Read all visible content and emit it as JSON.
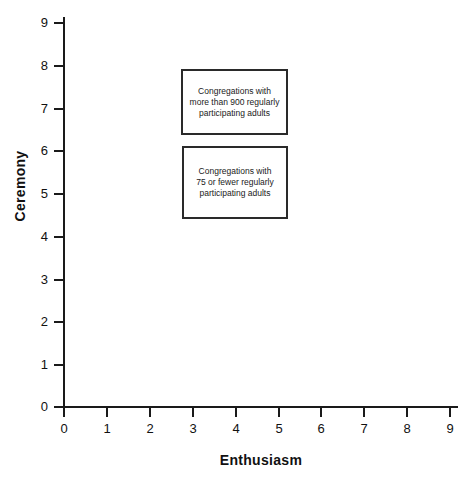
{
  "chart_data": {
    "type": "scatter",
    "title": "",
    "xlabel": "Enthusiasm",
    "ylabel": "Ceremony",
    "xlim": [
      0,
      9
    ],
    "ylim": [
      0,
      9
    ],
    "xticks": [
      "0",
      "1",
      "2",
      "3",
      "4",
      "5",
      "6",
      "7",
      "8",
      "9"
    ],
    "yticks": [
      "0",
      "1",
      "2",
      "3",
      "4",
      "5",
      "6",
      "7",
      "8",
      "9"
    ],
    "grid": false,
    "legend_position": "none",
    "series": [],
    "annotations": [
      {
        "id": "large-congregations",
        "text": "Congregations with\nmore than 900 regularly\nparticipating adults",
        "x_range": [
          2.73,
          5.23
        ],
        "y_range": [
          6.35,
          7.89
        ]
      },
      {
        "id": "small-congregations",
        "text": "Congregations with\n75 or fewer regularly\nparticipating adults",
        "x_range": [
          2.75,
          5.23
        ],
        "y_range": [
          4.4,
          6.09
        ]
      }
    ]
  },
  "axes": {
    "x": {
      "title": "Enthusiasm",
      "ticks": [
        {
          "value": "0",
          "px": 64
        },
        {
          "value": "1",
          "px": 107
        },
        {
          "value": "2",
          "px": 150
        },
        {
          "value": "3",
          "px": 193
        },
        {
          "value": "4",
          "px": 236
        },
        {
          "value": "5",
          "px": 279
        },
        {
          "value": "6",
          "px": 321
        },
        {
          "value": "7",
          "px": 364
        },
        {
          "value": "8",
          "px": 407
        },
        {
          "value": "9",
          "px": 450
        }
      ]
    },
    "y": {
      "title": "Ceremony",
      "ticks": [
        {
          "value": "9",
          "px": 22
        },
        {
          "value": "8",
          "px": 65
        },
        {
          "value": "7",
          "px": 108
        },
        {
          "value": "6",
          "px": 150
        },
        {
          "value": "5",
          "px": 193
        },
        {
          "value": "4",
          "px": 236
        },
        {
          "value": "3",
          "px": 279
        },
        {
          "value": "2",
          "px": 321
        },
        {
          "value": "1",
          "px": 364
        },
        {
          "value": "0",
          "px": 406
        }
      ]
    }
  },
  "colors": {
    "axis": "#1a1a1a",
    "text": "#111111",
    "box_border": "#2a2a2a",
    "background": "#ffffff"
  }
}
